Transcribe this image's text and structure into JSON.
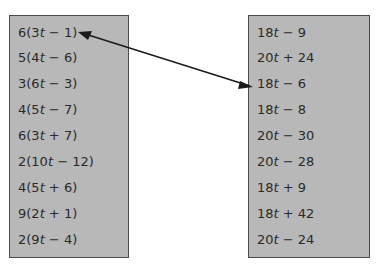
{
  "left_column": {
    "items": [
      {
        "pre": "6(3",
        "var": "t",
        "post": " − 1)"
      },
      {
        "pre": "5(4",
        "var": "t",
        "post": " − 6)"
      },
      {
        "pre": "3(6",
        "var": "t",
        "post": " − 3)"
      },
      {
        "pre": "4(5",
        "var": "t",
        "post": " − 7)"
      },
      {
        "pre": "6(3",
        "var": "t",
        "post": " + 7)"
      },
      {
        "pre": "2(10",
        "var": "t",
        "post": " − 12)"
      },
      {
        "pre": "4(5",
        "var": "t",
        "post": " + 6)"
      },
      {
        "pre": "9(2",
        "var": "t",
        "post": " + 1)"
      },
      {
        "pre": "2(9",
        "var": "t",
        "post": " − 4)"
      }
    ]
  },
  "right_column": {
    "items": [
      {
        "pre": "18",
        "var": "t",
        "post": " − 9"
      },
      {
        "pre": "20",
        "var": "t",
        "post": " + 24"
      },
      {
        "pre": "18",
        "var": "t",
        "post": " − 6"
      },
      {
        "pre": "18",
        "var": "t",
        "post": " − 8"
      },
      {
        "pre": "20",
        "var": "t",
        "post": " − 30"
      },
      {
        "pre": "20",
        "var": "t",
        "post": " − 28"
      },
      {
        "pre": "18",
        "var": "t",
        "post": " + 9"
      },
      {
        "pre": "18",
        "var": "t",
        "post": " + 42"
      },
      {
        "pre": "20",
        "var": "t",
        "post": " − 24"
      }
    ]
  },
  "connection": {
    "from": "6(3t − 1)",
    "to": "18t − 6",
    "style": "double-headed arrow"
  },
  "colors": {
    "box_fill": "#b8b8b8",
    "box_border": "#4a4a4a",
    "text": "#2a2a2a",
    "arrow": "#1a1a1a"
  }
}
